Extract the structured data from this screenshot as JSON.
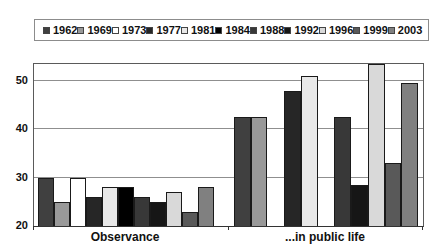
{
  "chart_data": {
    "type": "bar",
    "title": "",
    "categories": [
      "Observance",
      "...in public life"
    ],
    "series": [
      {
        "name": "1962",
        "color": "#404040",
        "values": [
          30,
          42.5
        ]
      },
      {
        "name": "1969",
        "color": "#999999",
        "values": [
          25,
          42.5
        ]
      },
      {
        "name": "1973",
        "color": "#ffffff",
        "values": [
          30,
          null
        ]
      },
      {
        "name": "1977",
        "color": "#262626",
        "values": [
          26,
          48
        ]
      },
      {
        "name": "1981",
        "color": "#e8e8e8",
        "values": [
          28,
          51
        ]
      },
      {
        "name": "1984",
        "color": "#000000",
        "values": [
          28,
          null
        ]
      },
      {
        "name": "1988",
        "color": "#383838",
        "values": [
          26,
          42.5
        ]
      },
      {
        "name": "1992",
        "color": "#161616",
        "values": [
          25,
          28.5
        ]
      },
      {
        "name": "1996",
        "color": "#d9d9d9",
        "values": [
          27,
          53.4
        ]
      },
      {
        "name": "1999",
        "color": "#595959",
        "values": [
          23,
          33
        ]
      },
      {
        "name": "2003",
        "color": "#808080",
        "values": [
          28,
          49.5
        ]
      }
    ],
    "ylim": [
      20,
      53.5
    ],
    "yticks": [
      20,
      30,
      40,
      50
    ],
    "grid": true,
    "legend_position": "top"
  },
  "colors": {
    "background": "#ffffff",
    "plot_border": "#5a5a5a",
    "gridline": "#8f8f8f",
    "bar_outline": "#1a1a1a",
    "legend_border": "#8c8c8c",
    "text": "#111111"
  }
}
